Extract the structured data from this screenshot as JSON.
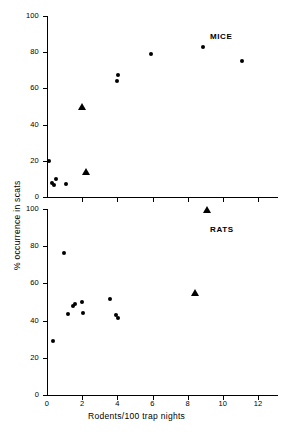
{
  "figure": {
    "xlabel": "Rodents/100 trap nights",
    "ylabel": "% occurrence in scats"
  },
  "chart_data": [
    {
      "type": "scatter",
      "title": "MICE",
      "panel": "top",
      "xlabel": "",
      "ylabel": "% occurrence in scats",
      "xlim": [
        0,
        12
      ],
      "ylim": [
        0,
        100
      ],
      "xticks": [
        0,
        2,
        4,
        6,
        8,
        10,
        12
      ],
      "xticklabels": [
        "",
        "",
        "",
        "",
        "",
        "",
        ""
      ],
      "yticks": [
        0,
        20,
        40,
        60,
        80,
        100
      ],
      "yticklabels": [
        "0",
        "20",
        "40",
        "60",
        "80",
        "100"
      ],
      "grid": false,
      "legend": "none",
      "series": [
        {
          "name": "circle-marker",
          "marker": "circle",
          "points": [
            {
              "x": 0.1,
              "y": 20.0
            },
            {
              "x": 0.28,
              "y": 8.0
            },
            {
              "x": 0.38,
              "y": 6.8
            },
            {
              "x": 0.52,
              "y": 10.0
            },
            {
              "x": 1.1,
              "y": 7.0
            },
            {
              "x": 3.98,
              "y": 64.0
            },
            {
              "x": 4.05,
              "y": 67.5
            },
            {
              "x": 5.9,
              "y": 79.0
            },
            {
              "x": 8.9,
              "y": 83.0
            },
            {
              "x": 11.1,
              "y": 75.0
            }
          ]
        },
        {
          "name": "triangle-marker",
          "marker": "triangle",
          "points": [
            {
              "x": 2.0,
              "y": 49.5
            },
            {
              "x": 2.2,
              "y": 14.0
            }
          ]
        }
      ]
    },
    {
      "type": "scatter",
      "title": "RATS",
      "panel": "bottom",
      "xlabel": "Rodents/100 trap nights",
      "ylabel": "% occurrence in scats",
      "xlim": [
        0,
        12
      ],
      "ylim": [
        0,
        100
      ],
      "xticks": [
        0,
        2,
        4,
        6,
        8,
        10,
        12
      ],
      "xticklabels": [
        "0",
        "2",
        "4",
        "6",
        "8",
        "10",
        "12"
      ],
      "yticks": [
        0,
        20,
        40,
        60,
        80,
        100
      ],
      "yticklabels": [
        "0",
        "20",
        "40",
        "60",
        "80",
        "100"
      ],
      "grid": false,
      "legend": "none",
      "series": [
        {
          "name": "circle-marker",
          "marker": "circle",
          "points": [
            {
              "x": 0.35,
              "y": 29.0
            },
            {
              "x": 0.95,
              "y": 76.5
            },
            {
              "x": 1.2,
              "y": 43.5
            },
            {
              "x": 1.48,
              "y": 48.0
            },
            {
              "x": 1.6,
              "y": 49.0
            },
            {
              "x": 1.98,
              "y": 50.0
            },
            {
              "x": 2.05,
              "y": 44.0
            },
            {
              "x": 3.6,
              "y": 51.5
            },
            {
              "x": 3.9,
              "y": 43.0
            },
            {
              "x": 4.05,
              "y": 41.5
            }
          ]
        },
        {
          "name": "triangle-marker",
          "marker": "triangle",
          "points": [
            {
              "x": 8.4,
              "y": 55.0
            },
            {
              "x": 9.1,
              "y": 99.5
            }
          ]
        }
      ]
    }
  ]
}
